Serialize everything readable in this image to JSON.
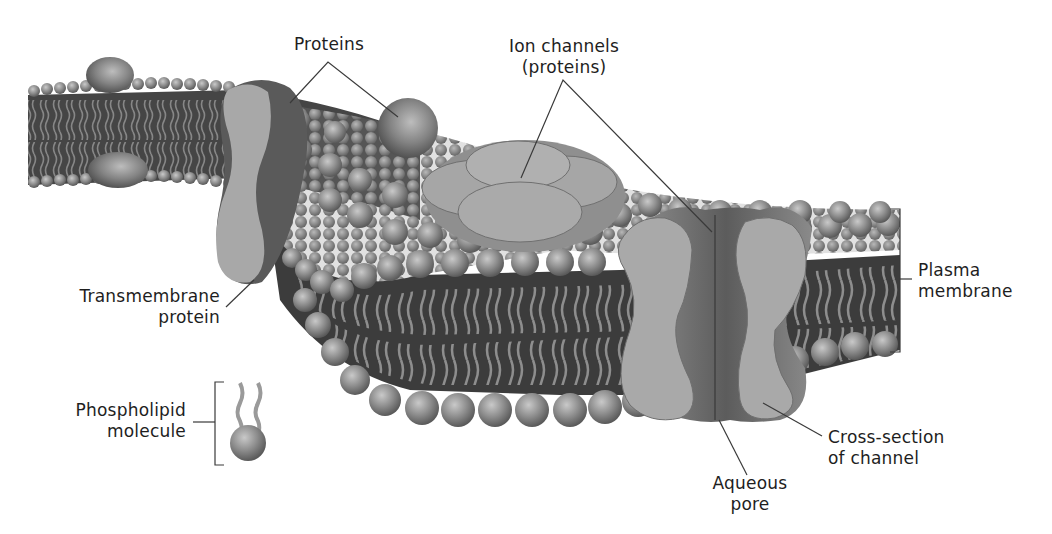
{
  "figure": {
    "colors": {
      "background": "#ffffff",
      "core": "#3c3c3c",
      "head": "#8e8e8e",
      "tail": "#9a9a9a",
      "protein": "#a8a8a8",
      "protein_dark": "#6a6a6a",
      "leader_line": "#3a3a3a",
      "text": "#1e1e1e"
    }
  },
  "labels": {
    "proteins": "Proteins",
    "ion_channels": [
      "Ion channels",
      "(proteins)"
    ],
    "transmembrane_protein": [
      "Transmembrane",
      "protein"
    ],
    "phospholipid_molecule": [
      "Phospholipid",
      "molecule"
    ],
    "plasma_membrane": [
      "Plasma",
      "membrane"
    ],
    "cross_section": [
      "Cross-section",
      "of channel"
    ],
    "aqueous_pore": [
      "Aqueous",
      "pore"
    ]
  }
}
